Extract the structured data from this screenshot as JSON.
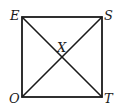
{
  "diagram": {
    "type": "square-with-diagonals",
    "vertices": [
      {
        "label": "E",
        "x": 22,
        "y": 17
      },
      {
        "label": "S",
        "x": 102,
        "y": 17
      },
      {
        "label": "T",
        "x": 102,
        "y": 97
      },
      {
        "label": "O",
        "x": 22,
        "y": 97
      }
    ],
    "intersection": {
      "label": "X",
      "x": 62,
      "y": 57
    },
    "stroke_color": "#1a1a1a"
  }
}
